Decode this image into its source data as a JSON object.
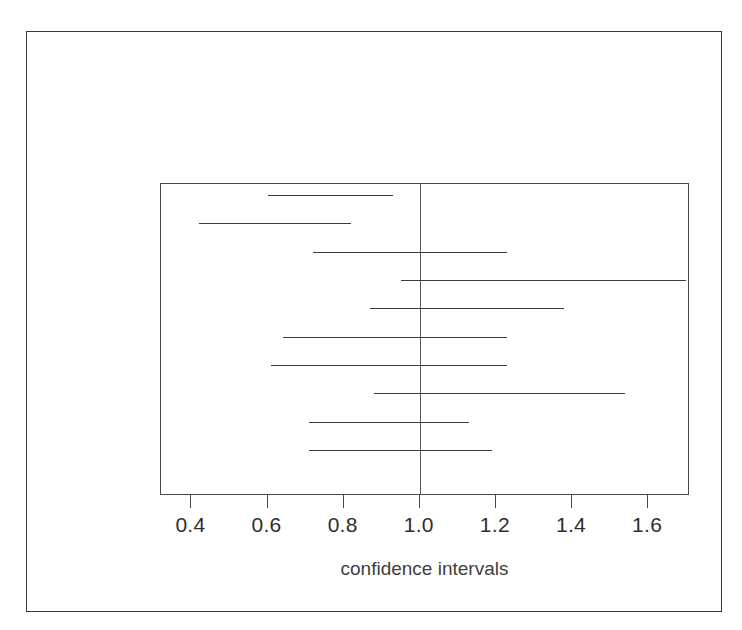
{
  "chart_data": {
    "type": "line",
    "title": "",
    "subtitle": "",
    "xlabel": "confidence intervals",
    "ylabel": "",
    "xlim": [
      0.32,
      1.71
    ],
    "ylim": [
      0,
      11
    ],
    "grid": false,
    "legend": null,
    "reference_line": {
      "orientation": "vertical",
      "value": 1.0,
      "label": "1.0"
    },
    "xticks": [
      0.4,
      0.6,
      0.8,
      1.0,
      1.2,
      1.4,
      1.6
    ],
    "xtick_labels": [
      "0.4",
      "0.6",
      "0.8",
      "1.0",
      "1.2",
      "1.4",
      "1.6"
    ],
    "yticks": [],
    "ytick_labels": [],
    "series": [
      {
        "name": "confidence interval",
        "orientation": "horizontal",
        "intervals": [
          {
            "index": 1,
            "lower": 0.6,
            "upper": 0.93,
            "crosses_one": false
          },
          {
            "index": 2,
            "lower": 0.42,
            "upper": 0.82,
            "crosses_one": false
          },
          {
            "index": 3,
            "lower": 0.72,
            "upper": 1.23,
            "crosses_one": true
          },
          {
            "index": 4,
            "lower": 0.95,
            "upper": 1.7,
            "crosses_one": true
          },
          {
            "index": 5,
            "lower": 0.87,
            "upper": 1.38,
            "crosses_one": true
          },
          {
            "index": 6,
            "lower": 0.64,
            "upper": 1.23,
            "crosses_one": true
          },
          {
            "index": 7,
            "lower": 0.61,
            "upper": 1.23,
            "crosses_one": true
          },
          {
            "index": 8,
            "lower": 0.88,
            "upper": 1.54,
            "crosses_one": true
          },
          {
            "index": 9,
            "lower": 0.71,
            "upper": 1.13,
            "crosses_one": true
          },
          {
            "index": 10,
            "lower": 0.71,
            "upper": 1.19,
            "crosses_one": true
          }
        ]
      }
    ]
  },
  "colors": {
    "line": "#3b3b3b",
    "reference_line": "#555555",
    "axis": "#4a4a4a",
    "frame": "#3a3a3a",
    "text": "#2e2e2e",
    "background": "#ffffff"
  }
}
